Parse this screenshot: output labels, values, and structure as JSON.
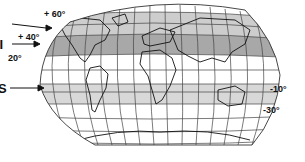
{
  "map": {
    "type": "world-map-pseudocylindrical",
    "graticule": "meridians and parallels",
    "bands": [
      {
        "name": "band-60-40",
        "from": "+60°",
        "to": "+40°",
        "shade": "#c8c8c8"
      },
      {
        "name": "band-40-20",
        "from": "+40°",
        "to": "+20°",
        "shade": "#a9a9a9"
      },
      {
        "name": "band-10-30",
        "from": "-10°",
        "to": "-30°",
        "shade": "#d6d6d6"
      }
    ],
    "colors": {
      "graticule": "#333333",
      "coast": "#111111",
      "background": "#ffffff"
    }
  },
  "labels": {
    "left": [
      {
        "marker": "I",
        "lat": "+ 60°"
      },
      {
        "marker": "II",
        "lat": "+ 40°"
      },
      {
        "marker": "",
        "lat": "20°"
      },
      {
        "marker": "S",
        "lat": ""
      }
    ],
    "right": [
      {
        "lat": "-10°"
      },
      {
        "lat": "-30°"
      }
    ]
  }
}
